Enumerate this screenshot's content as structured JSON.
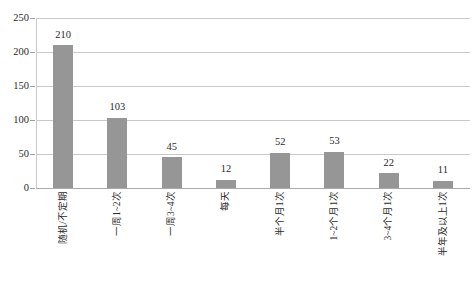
{
  "chart_data": {
    "type": "bar",
    "title": "",
    "xlabel": "",
    "ylabel": "",
    "categories": [
      "随机/不定期",
      "一周1~2次",
      "一周3~4次",
      "每天",
      "半个月1次",
      "1~2个月1次",
      "3~4个月1次",
      "半年及以上1次"
    ],
    "values": [
      210,
      103,
      45,
      12,
      52,
      53,
      22,
      11
    ],
    "ylim": [
      0,
      250
    ],
    "yticks": [
      0,
      50,
      100,
      150,
      200,
      250
    ],
    "ytick_labels": [
      "0",
      "50",
      "100",
      "150",
      "200",
      "250"
    ],
    "value_labels": [
      "210",
      "103",
      "45",
      "12",
      "52",
      "53",
      "22",
      "11"
    ],
    "grid": true,
    "grid_axis": "y",
    "legend": false,
    "legend_position": "none",
    "bar_color": "#969696",
    "grid_color": "#c9c9c9",
    "axis_color": "#a9a9a9",
    "text_color": "#2b2b2b",
    "background": "#ffffff"
  }
}
